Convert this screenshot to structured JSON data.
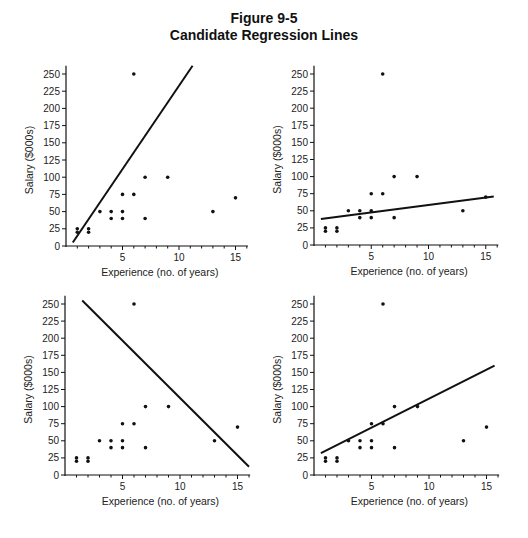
{
  "figure": {
    "title_line1": "Figure 9-5",
    "title_line2": "Candidate Regression Lines"
  },
  "axis": {
    "xlabel": "Experience (no. of years)",
    "ylabel": "Salary ($000s)",
    "xticks": [
      5,
      10,
      15
    ],
    "yticks": [
      0,
      25,
      50,
      75,
      100,
      125,
      150,
      175,
      200,
      225,
      250
    ]
  },
  "colors": {
    "ink": "#111111",
    "background": "#ffffff"
  },
  "chart_data": [
    {
      "type": "scatter",
      "panel": "top-left",
      "title": "",
      "xlabel": "Experience (no. of years)",
      "ylabel": "Salary ($000s)",
      "xlim": [
        0,
        16
      ],
      "ylim": [
        0,
        260
      ],
      "xticks": [
        5,
        10,
        15
      ],
      "yticks": [
        0,
        25,
        50,
        75,
        100,
        125,
        150,
        175,
        200,
        225,
        250
      ],
      "grid": false,
      "points": [
        [
          1,
          20
        ],
        [
          1,
          25
        ],
        [
          2,
          20
        ],
        [
          2,
          25
        ],
        [
          3,
          50
        ],
        [
          4,
          40
        ],
        [
          4,
          50
        ],
        [
          5,
          40
        ],
        [
          5,
          50
        ],
        [
          5,
          75
        ],
        [
          6,
          75
        ],
        [
          6,
          250
        ],
        [
          7,
          40
        ],
        [
          7,
          100
        ],
        [
          9,
          100
        ],
        [
          13,
          50
        ],
        [
          15,
          70
        ]
      ],
      "line": {
        "x1": 0.6,
        "y1": 5,
        "x2": 11.2,
        "y2": 262
      }
    },
    {
      "type": "scatter",
      "panel": "top-right",
      "title": "",
      "xlabel": "Experience (no. of years)",
      "ylabel": "Salary ($000s)",
      "xlim": [
        0,
        16
      ],
      "ylim": [
        0,
        260
      ],
      "xticks": [
        5,
        10,
        15
      ],
      "yticks": [
        0,
        25,
        50,
        75,
        100,
        125,
        150,
        175,
        200,
        225,
        250
      ],
      "grid": false,
      "points": [
        [
          1,
          20
        ],
        [
          1,
          25
        ],
        [
          2,
          20
        ],
        [
          2,
          25
        ],
        [
          3,
          50
        ],
        [
          4,
          40
        ],
        [
          4,
          50
        ],
        [
          5,
          40
        ],
        [
          5,
          50
        ],
        [
          5,
          75
        ],
        [
          6,
          75
        ],
        [
          6,
          250
        ],
        [
          7,
          40
        ],
        [
          7,
          100
        ],
        [
          9,
          100
        ],
        [
          13,
          50
        ],
        [
          15,
          70
        ]
      ],
      "line": {
        "x1": 0.6,
        "y1": 38,
        "x2": 15.7,
        "y2": 71
      }
    },
    {
      "type": "scatter",
      "panel": "bottom-left",
      "title": "",
      "xlabel": "Experience (no. of years)",
      "ylabel": "Salary ($000s)",
      "xlim": [
        0,
        16
      ],
      "ylim": [
        0,
        260
      ],
      "xticks": [
        5,
        10,
        15
      ],
      "yticks": [
        0,
        25,
        50,
        75,
        100,
        125,
        150,
        175,
        200,
        225,
        250
      ],
      "grid": false,
      "points": [
        [
          1,
          20
        ],
        [
          1,
          25
        ],
        [
          2,
          20
        ],
        [
          2,
          25
        ],
        [
          3,
          50
        ],
        [
          4,
          40
        ],
        [
          4,
          50
        ],
        [
          5,
          40
        ],
        [
          5,
          50
        ],
        [
          5,
          75
        ],
        [
          6,
          75
        ],
        [
          6,
          250
        ],
        [
          7,
          40
        ],
        [
          7,
          100
        ],
        [
          9,
          100
        ],
        [
          13,
          50
        ],
        [
          15,
          70
        ]
      ],
      "line": {
        "x1": 1.5,
        "y1": 255,
        "x2": 16,
        "y2": 12
      }
    },
    {
      "type": "scatter",
      "panel": "bottom-right",
      "title": "",
      "xlabel": "Experience (no. of years)",
      "ylabel": "Salary ($000s)",
      "xlim": [
        0,
        16
      ],
      "ylim": [
        0,
        260
      ],
      "xticks": [
        5,
        10,
        15
      ],
      "yticks": [
        0,
        25,
        50,
        75,
        100,
        125,
        150,
        175,
        200,
        225,
        250
      ],
      "grid": false,
      "points": [
        [
          1,
          20
        ],
        [
          1,
          25
        ],
        [
          2,
          20
        ],
        [
          2,
          25
        ],
        [
          3,
          50
        ],
        [
          4,
          40
        ],
        [
          4,
          50
        ],
        [
          5,
          40
        ],
        [
          5,
          50
        ],
        [
          5,
          75
        ],
        [
          6,
          75
        ],
        [
          6,
          250
        ],
        [
          7,
          40
        ],
        [
          7,
          100
        ],
        [
          9,
          100
        ],
        [
          13,
          50
        ],
        [
          15,
          70
        ]
      ],
      "line": {
        "x1": 0.6,
        "y1": 32,
        "x2": 15.7,
        "y2": 160
      }
    }
  ],
  "layout": {
    "panels": [
      {
        "ox": 66,
        "oy": 246,
        "px_per_x": 11.3,
        "px_per_y": 0.688,
        "xmax": 16.1,
        "ytop": 262
      },
      {
        "ox": 314,
        "oy": 245,
        "px_per_x": 11.45,
        "px_per_y": 0.684,
        "xmax": 16.1,
        "ytop": 262
      },
      {
        "ox": 65,
        "oy": 475,
        "px_per_x": 11.5,
        "px_per_y": 0.684,
        "xmax": 16.1,
        "ytop": 262
      },
      {
        "ox": 314,
        "oy": 475,
        "px_per_x": 11.5,
        "px_per_y": 0.684,
        "xmax": 16.1,
        "ytop": 262
      }
    ]
  }
}
